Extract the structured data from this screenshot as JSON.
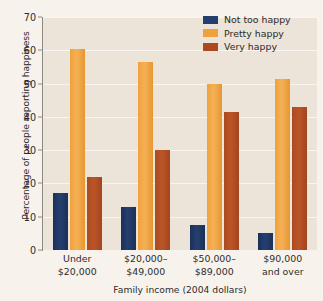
{
  "chart_data": {
    "type": "bar",
    "title": "",
    "xlabel": "Family income (2004 dollars)",
    "ylabel": "Percentage of people reporting happiness",
    "categories": [
      "Under\n$20,000",
      "$20,000–\n$49,000",
      "$50,000–\n$89,000",
      "$90,000\nand over"
    ],
    "series": [
      {
        "name": "Not too happy",
        "color": "#22406d",
        "values": [
          17,
          13,
          7.5,
          5
        ]
      },
      {
        "name": "Pretty happy",
        "color": "#efa23c",
        "values": [
          60.5,
          56.5,
          50,
          51.5
        ]
      },
      {
        "name": "Very happy",
        "color": "#ab4a22",
        "values": [
          22,
          30,
          41.5,
          43
        ]
      }
    ],
    "ylim": [
      0,
      70
    ],
    "ytick_step": 10,
    "yticks": [
      0,
      10,
      20,
      30,
      40,
      50,
      60,
      70
    ],
    "ytick_labels": [
      "0",
      "10",
      "20",
      "30",
      "40",
      "50",
      "60",
      "70"
    ],
    "grid": true,
    "legend_position": "top-right",
    "plot_background": "#ece3d9",
    "figure_background": "#f7f3ec"
  }
}
